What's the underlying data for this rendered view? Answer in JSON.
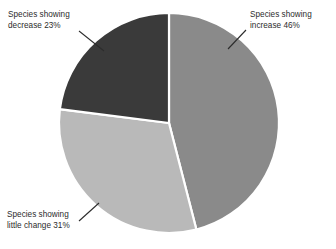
{
  "chart_data": {
    "type": "pie",
    "title": "",
    "subtitle": "",
    "xlabel": "",
    "ylabel": "",
    "legend_position": "callout-labels",
    "grid": false,
    "unit": "%",
    "total": 100,
    "categories": [
      "Species showing increase",
      "Species showing little change",
      "Species showing decrease"
    ],
    "values": [
      46,
      31,
      23
    ],
    "start_angle_deg": 0,
    "direction": "clockwise",
    "slices": [
      {
        "key": "increase",
        "label_line1": "Species showing",
        "label_line2": "increase 46%",
        "label_full": "Species showing increase 46%",
        "value": 46,
        "value_text": "46%",
        "color": "#8a8a8a",
        "start_deg": 0,
        "end_deg": 165.6
      },
      {
        "key": "little-change",
        "label_line1": "Species showing",
        "label_line2": "little change 31%",
        "label_full": "Species showing little change 31%",
        "value": 31,
        "value_text": "31%",
        "color": "#b9b9b9",
        "start_deg": 165.6,
        "end_deg": 277.2
      },
      {
        "key": "decrease",
        "label_line1": "Species showing",
        "label_line2": "decrease 23%",
        "label_full": "Species showing decrease 23%",
        "value": 23,
        "value_text": "23%",
        "color": "#3a3a3a",
        "start_deg": 277.2,
        "end_deg": 360
      }
    ],
    "colors": {
      "increase": "#8a8a8a",
      "little_change": "#b9b9b9",
      "decrease": "#3a3a3a",
      "separator": "#ffffff",
      "text": "#2c2c2c",
      "background": "#ffffff",
      "leader_line": "#3a3a3a"
    },
    "geometry": {
      "center_x": 169,
      "center_y": 123,
      "radius": 110
    }
  },
  "labels": {
    "decrease": {
      "line1": "Species showing",
      "line2": "decrease 23%"
    },
    "increase": {
      "line1": "Species showing",
      "line2": "increase 46%"
    },
    "little_change": {
      "line1": "Species showing",
      "line2": "little change 31%"
    }
  }
}
